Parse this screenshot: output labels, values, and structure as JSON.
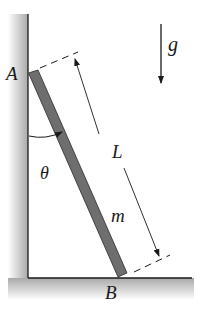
{
  "diagram": {
    "labels": {
      "point_a": "A",
      "point_b": "B",
      "length": "L",
      "mass": "m",
      "angle": "θ",
      "gravity": "g"
    },
    "colors": {
      "rod": "#6e6e6e",
      "rod_edge": "#2a2a2a",
      "wall_shade": "#b0b0b0",
      "line": "#1a1a1a"
    }
  }
}
